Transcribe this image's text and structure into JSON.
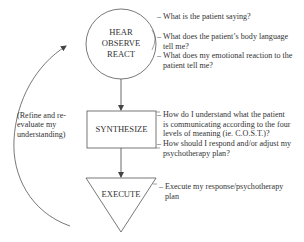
{
  "nodes": {
    "observe": {
      "shape": "circle",
      "lines": [
        "HEAR",
        "OBSERVE",
        "REACT"
      ]
    },
    "synthesize": {
      "shape": "rectangle",
      "label": "SYNTHESIZE"
    },
    "execute": {
      "shape": "inverted-triangle",
      "label": "EXECUTE"
    }
  },
  "feedback_loop": {
    "lines": [
      "(Refine and re-",
      "evaluate my",
      "understanding)"
    ]
  },
  "bullets": {
    "observe": [
      {
        "dash": "–",
        "lines": [
          "What is the patient saying?"
        ]
      },
      {
        "dash": "–",
        "lines": [
          "What does the patient’s body language",
          "tell me?"
        ]
      },
      {
        "dash": "–",
        "lines": [
          "What does my emotional reaction to the",
          "patient tell me?"
        ]
      }
    ],
    "synthesize": [
      {
        "dash": "–",
        "lines": [
          "How do I understand what the patient",
          "is communicating according to the four",
          "levels of meaning (ie. C.O.S.T.)?"
        ]
      },
      {
        "dash": "–",
        "lines": [
          "How should I respond and/or adjust my",
          "psychotherapy plan?"
        ]
      }
    ],
    "execute": [
      {
        "dash": "–",
        "lines": [
          "Execute my response/psychotherapy",
          "plan"
        ]
      }
    ]
  },
  "colors": {
    "stroke": "#555555",
    "text": "#333333",
    "background": "#ffffff"
  }
}
